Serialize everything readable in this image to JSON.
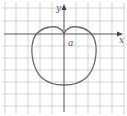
{
  "figure": {
    "type": "polar-curve",
    "curve": "cardioid",
    "equation_hint": "r = a(1 - sin θ)",
    "labels": {
      "x_axis": "x",
      "y_axis": "y",
      "parameter": "a"
    },
    "grid": true,
    "colors": {
      "grid": "#c8c8c8",
      "axis": "#555555",
      "curve": "#6a6a6a",
      "background": "#ffffff"
    }
  }
}
